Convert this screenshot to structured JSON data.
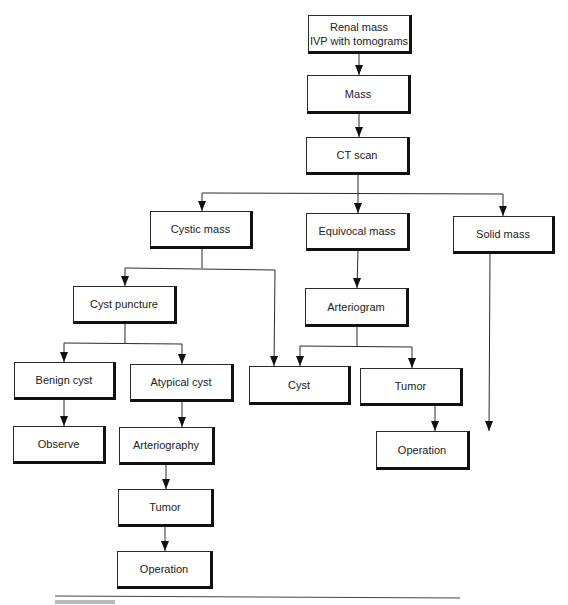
{
  "diagram": {
    "type": "flowchart",
    "nodes": [
      {
        "id": "renal_mass",
        "label": "Renal mass\nIVP with tomograms",
        "x": 308,
        "y": 15,
        "w": 104,
        "h": 39
      },
      {
        "id": "mass",
        "label": "Mass",
        "x": 307,
        "y": 75,
        "w": 104,
        "h": 39
      },
      {
        "id": "ct_scan",
        "label": "CT scan",
        "x": 306,
        "y": 137,
        "w": 104,
        "h": 38
      },
      {
        "id": "cystic_mass",
        "label": "Cystic mass",
        "x": 150,
        "y": 211,
        "w": 103,
        "h": 38
      },
      {
        "id": "equivocal_mass",
        "label": "Equivocal mass",
        "x": 306,
        "y": 213,
        "w": 104,
        "h": 38
      },
      {
        "id": "solid_mass",
        "label": "Solid mass",
        "x": 453,
        "y": 216,
        "w": 102,
        "h": 38
      },
      {
        "id": "cyst_puncture",
        "label": "Cyst puncture",
        "x": 73,
        "y": 286,
        "w": 104,
        "h": 38
      },
      {
        "id": "arteriogram",
        "label": "Arteriogram",
        "x": 305,
        "y": 288,
        "w": 104,
        "h": 39
      },
      {
        "id": "benign_cyst",
        "label": "Benign cyst",
        "x": 14,
        "y": 362,
        "w": 102,
        "h": 38
      },
      {
        "id": "atypical_cyst",
        "label": "Atypical cyst",
        "x": 130,
        "y": 364,
        "w": 104,
        "h": 38
      },
      {
        "id": "cyst",
        "label": "Cyst",
        "x": 249,
        "y": 366,
        "w": 102,
        "h": 39
      },
      {
        "id": "tumor_right",
        "label": "Tumor",
        "x": 360,
        "y": 368,
        "w": 103,
        "h": 38
      },
      {
        "id": "observe",
        "label": "Observe",
        "x": 13,
        "y": 426,
        "w": 93,
        "h": 38
      },
      {
        "id": "arteriography",
        "label": "Arteriography",
        "x": 119,
        "y": 427,
        "w": 96,
        "h": 38
      },
      {
        "id": "operation_right",
        "label": "Operation",
        "x": 376,
        "y": 431,
        "w": 94,
        "h": 39
      },
      {
        "id": "tumor_bottom",
        "label": "Tumor",
        "x": 118,
        "y": 489,
        "w": 96,
        "h": 38
      },
      {
        "id": "operation_bottom",
        "label": "Operation",
        "x": 117,
        "y": 551,
        "w": 96,
        "h": 38
      }
    ],
    "edges": [
      {
        "from": "renal_mass",
        "to": "mass"
      },
      {
        "from": "mass",
        "to": "ct_scan"
      },
      {
        "from": "ct_scan",
        "to": "cystic_mass"
      },
      {
        "from": "ct_scan",
        "to": "equivocal_mass"
      },
      {
        "from": "ct_scan",
        "to": "solid_mass"
      },
      {
        "from": "cystic_mass",
        "to": "cyst_puncture"
      },
      {
        "from": "cystic_mass",
        "to": "cyst"
      },
      {
        "from": "equivocal_mass",
        "to": "arteriogram"
      },
      {
        "from": "cyst_puncture",
        "to": "benign_cyst"
      },
      {
        "from": "cyst_puncture",
        "to": "atypical_cyst"
      },
      {
        "from": "arteriogram",
        "to": "cyst"
      },
      {
        "from": "arteriogram",
        "to": "tumor_right"
      },
      {
        "from": "benign_cyst",
        "to": "observe"
      },
      {
        "from": "atypical_cyst",
        "to": "arteriography"
      },
      {
        "from": "arteriography",
        "to": "tumor_bottom"
      },
      {
        "from": "tumor_bottom",
        "to": "operation_bottom"
      },
      {
        "from": "tumor_right",
        "to": "operation_right"
      },
      {
        "from": "solid_mass",
        "to": "operation_right"
      }
    ],
    "polylines": [
      [
        [
          359,
          54
        ],
        [
          359,
          75
        ]
      ],
      [
        [
          359,
          114
        ],
        [
          359,
          137
        ]
      ],
      [
        [
          358,
          175
        ],
        [
          358,
          213
        ]
      ],
      [
        [
          202,
          193
        ],
        [
          503,
          194
        ]
      ],
      [
        [
          202,
          193
        ],
        [
          202,
          211
        ]
      ],
      [
        [
          503,
          194
        ],
        [
          503,
          216
        ]
      ],
      [
        [
          202,
          249
        ],
        [
          202,
          268
        ]
      ],
      [
        [
          125,
          268
        ],
        [
          275,
          270
        ]
      ],
      [
        [
          125,
          268
        ],
        [
          125,
          286
        ]
      ],
      [
        [
          275,
          270
        ],
        [
          274,
          366
        ]
      ],
      [
        [
          358,
          251
        ],
        [
          357,
          288
        ]
      ],
      [
        [
          125,
          324
        ],
        [
          125,
          343
        ]
      ],
      [
        [
          64,
          343
        ],
        [
          182,
          344
        ]
      ],
      [
        [
          64,
          343
        ],
        [
          64,
          362
        ]
      ],
      [
        [
          182,
          344
        ],
        [
          182,
          364
        ]
      ],
      [
        [
          357,
          327
        ],
        [
          357,
          346
        ]
      ],
      [
        [
          300,
          346
        ],
        [
          412,
          347
        ]
      ],
      [
        [
          300,
          346
        ],
        [
          300,
          366
        ]
      ],
      [
        [
          412,
          347
        ],
        [
          412,
          368
        ]
      ],
      [
        [
          64,
          400
        ],
        [
          64,
          426
        ]
      ],
      [
        [
          182,
          402
        ],
        [
          182,
          427
        ]
      ],
      [
        [
          166,
          465
        ],
        [
          166,
          489
        ]
      ],
      [
        [
          165,
          527
        ],
        [
          165,
          551
        ]
      ],
      [
        [
          435,
          406
        ],
        [
          435,
          431
        ]
      ],
      [
        [
          490,
          254
        ],
        [
          489,
          431
        ]
      ]
    ],
    "arrowheads": [
      [
        359,
        75
      ],
      [
        359,
        137
      ],
      [
        202,
        211
      ],
      [
        358,
        213
      ],
      [
        503,
        216
      ],
      [
        125,
        286
      ],
      [
        357,
        288
      ],
      [
        64,
        362
      ],
      [
        182,
        364
      ],
      [
        274,
        366
      ],
      [
        300,
        366
      ],
      [
        412,
        368
      ],
      [
        64,
        426
      ],
      [
        182,
        427
      ],
      [
        435,
        431
      ],
      [
        489,
        431
      ],
      [
        166,
        489
      ],
      [
        165,
        551
      ]
    ],
    "rule": {
      "x1": 55,
      "y1": 596,
      "x2": 460,
      "y2": 598
    },
    "colors": {
      "line": "#2b2b2b",
      "box_border": "#2a2a2a",
      "shadow": "#111111",
      "text": "#222222",
      "background": "#ffffff"
    }
  }
}
